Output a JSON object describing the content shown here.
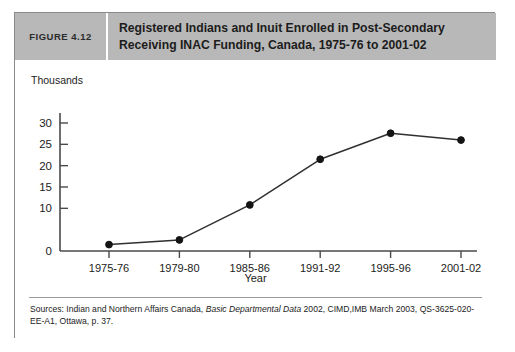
{
  "figure": {
    "number_label": "FIGURE 4.12",
    "title_line1": "Registered Indians and Inuit Enrolled in Post-Secondary",
    "title_line2": "Receiving INAC Funding, Canada, 1975-76 to 2001-02",
    "header_bg": "#b8b8b8",
    "border_color": "#8a8a8a"
  },
  "source": {
    "prefix": "Sources: Indian and Northern Affairs Canada, ",
    "italic": "Basic Departmental Data",
    "suffix": " 2002, CIMD,IMB March 2003, QS-3625-020-EE-A1, Ottawa, p. 37."
  },
  "chart_data": {
    "type": "line",
    "title": "Registered Indians and Inuit Enrolled in Post-Secondary Receiving INAC Funding, Canada, 1975-76 to 2001-02",
    "unit_label": "Thousands",
    "xlabel": "Year",
    "ylabel": "",
    "categories": [
      "1975-76",
      "1979-80",
      "1985-86",
      "1991-92",
      "1995-96",
      "2001-02"
    ],
    "values": [
      1.5,
      2.6,
      10.8,
      21.5,
      27.6,
      26.0
    ],
    "series": [
      {
        "name": "Enrolment (thousands)",
        "values": [
          1.5,
          2.6,
          10.8,
          21.5,
          27.6,
          26.0
        ]
      }
    ],
    "ylim": [
      0,
      31
    ],
    "ytick_values": [
      0,
      10,
      15,
      20,
      25,
      30
    ],
    "ytick_labels": [
      "0",
      "10",
      "15",
      "20",
      "25",
      "30"
    ],
    "grid": false,
    "legend": "none",
    "line_color": "#303030",
    "marker_color": "#141414",
    "marker": "circle"
  }
}
